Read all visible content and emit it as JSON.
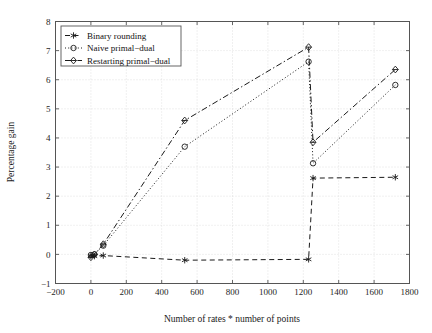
{
  "chart_data": {
    "type": "line",
    "title": "",
    "xlabel": "Number of rates * number of points",
    "ylabel": "Percentage gain",
    "xlim": [
      -200,
      1800
    ],
    "ylim": [
      -1,
      8
    ],
    "xticks": [
      -200,
      0,
      200,
      400,
      600,
      800,
      1000,
      1200,
      1400,
      1600,
      1800
    ],
    "xtick_labels": [
      "−200",
      "0",
      "200",
      "400",
      "600",
      "800",
      "1000",
      "1200",
      "1400",
      "1600",
      "1800"
    ],
    "yticks": [
      -1,
      0,
      1,
      2,
      3,
      4,
      5,
      6,
      7,
      8
    ],
    "ytick_labels": [
      "−1",
      "0",
      "1",
      "2",
      "3",
      "4",
      "5",
      "6",
      "7",
      "8"
    ],
    "grid": true,
    "legend_position": "upper left",
    "series": [
      {
        "name": "Binary rounding",
        "marker": "star",
        "linestyle": "dashed",
        "color": "#1a1a1a",
        "x": [
          0,
          20,
          70,
          530,
          1230,
          1255,
          1720
        ],
        "y": [
          -0.05,
          -0.06,
          -0.04,
          -0.2,
          -0.17,
          2.62,
          2.65
        ]
      },
      {
        "name": "Naive primal−dual",
        "marker": "circle",
        "linestyle": "dotted",
        "color": "#1a1a1a",
        "x": [
          0,
          20,
          70,
          530,
          1230,
          1255,
          1720
        ],
        "y": [
          -0.02,
          0.0,
          0.3,
          3.7,
          6.62,
          3.13,
          5.82
        ]
      },
      {
        "name": "Restarting primal−dual",
        "marker": "diamond",
        "linestyle": "dashdot",
        "color": "#1a1a1a",
        "x": [
          0,
          20,
          70,
          530,
          1230,
          1255,
          1720
        ],
        "y": [
          -0.1,
          0.0,
          0.35,
          4.6,
          7.12,
          3.85,
          6.35
        ]
      }
    ]
  },
  "axes": {
    "xlabel": "Number of rates * number of points",
    "ylabel": "Percentage gain"
  },
  "legend": {
    "entries": [
      {
        "label": "Binary rounding",
        "icon": "star-marker-dashed-line"
      },
      {
        "label": "Naive primal−dual",
        "icon": "circle-marker-dotted-line"
      },
      {
        "label": "Restarting primal−dual",
        "icon": "diamond-marker-dashdot-line"
      }
    ]
  }
}
